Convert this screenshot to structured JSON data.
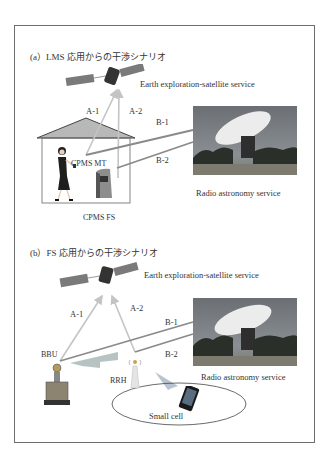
{
  "panels": [
    {
      "id": "a",
      "title": "(a）LMS 応用からの干渉シナリオ",
      "satellite_label": "Earth exploration-satellite service",
      "paths": {
        "a1": "A-1",
        "a2": "A-2",
        "b1": "B-1",
        "b2": "B-2"
      },
      "devices": {
        "mt": "CPMS MT",
        "fs": "CPMS FS"
      },
      "telescope_label": "Radio astronomy service"
    },
    {
      "id": "b",
      "title": "(b）FS 応用からの干渉シナリオ",
      "satellite_label": "Earth exploration-satellite service",
      "paths": {
        "a1": "A-1",
        "a2": "A-2",
        "b1": "B-1",
        "b2": "B-2"
      },
      "devices": {
        "bbu": "BBU",
        "rrh": "RRH",
        "cell": "Small cell"
      },
      "telescope_label": "Radio astronomy service"
    }
  ],
  "colors": {
    "frame": "#6e6e6e",
    "a_paths": "#c4c4c4",
    "b_paths": "#8a8a8a",
    "roof": "#b8b8b8",
    "sky": "#6f7378"
  }
}
